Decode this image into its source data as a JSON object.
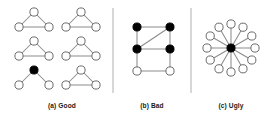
{
  "figure": {
    "background_color": "#ffffff",
    "width": 271,
    "height": 119,
    "node_fill_open": "#ffffff",
    "node_fill_filled": "#000000",
    "node_stroke": "#6b6b6b",
    "edge_color": "#8c8c8c",
    "divider_color": "#b0b0b0",
    "caption_color": "#1b1b1b"
  },
  "panels": [
    {
      "id": "good",
      "caption": "(a) Good",
      "caption_x": 62,
      "caption_y": 108,
      "graph_type": "triangle-motifs",
      "description": "Six three-node motifs arranged in a 2 by 3 grid; five are closed triangles, one has a filled hub and only two edges",
      "graphs": [
        {
          "id": "triangle-1",
          "row": 1,
          "column": 1,
          "nodes": [
            {
              "id": "apex",
              "x": 34,
              "y": 12,
              "fill": "open"
            },
            {
              "id": "left",
              "x": 19,
              "y": 27,
              "fill": "open"
            },
            {
              "id": "right",
              "x": 49,
              "y": 27,
              "fill": "open"
            }
          ],
          "edges": [
            [
              "apex",
              "left"
            ],
            [
              "apex",
              "right"
            ],
            [
              "left",
              "right"
            ]
          ]
        },
        {
          "id": "triangle-2",
          "row": 1,
          "column": 2,
          "nodes": [
            {
              "id": "apex",
              "x": 81,
              "y": 12,
              "fill": "open"
            },
            {
              "id": "left",
              "x": 66,
              "y": 27,
              "fill": "open"
            },
            {
              "id": "right",
              "x": 96,
              "y": 27,
              "fill": "open"
            }
          ],
          "edges": [
            [
              "apex",
              "left"
            ],
            [
              "apex",
              "right"
            ],
            [
              "left",
              "right"
            ]
          ]
        },
        {
          "id": "triangle-3",
          "row": 2,
          "column": 1,
          "nodes": [
            {
              "id": "apex",
              "x": 34,
              "y": 41,
              "fill": "open"
            },
            {
              "id": "left",
              "x": 19,
              "y": 56,
              "fill": "open"
            },
            {
              "id": "right",
              "x": 49,
              "y": 56,
              "fill": "open"
            }
          ],
          "edges": [
            [
              "apex",
              "left"
            ],
            [
              "apex",
              "right"
            ],
            [
              "left",
              "right"
            ]
          ]
        },
        {
          "id": "triangle-4",
          "row": 2,
          "column": 2,
          "nodes": [
            {
              "id": "apex",
              "x": 81,
              "y": 41,
              "fill": "open"
            },
            {
              "id": "left",
              "x": 66,
              "y": 56,
              "fill": "open"
            },
            {
              "id": "right",
              "x": 96,
              "y": 56,
              "fill": "open"
            }
          ],
          "edges": [
            [
              "apex",
              "left"
            ],
            [
              "apex",
              "right"
            ],
            [
              "left",
              "right"
            ]
          ]
        },
        {
          "id": "open-motif-filled-hub",
          "row": 3,
          "column": 1,
          "nodes": [
            {
              "id": "apex",
              "x": 34,
              "y": 70,
              "fill": "filled"
            },
            {
              "id": "left",
              "x": 19,
              "y": 85,
              "fill": "open"
            },
            {
              "id": "right",
              "x": 49,
              "y": 85,
              "fill": "open"
            }
          ],
          "edges": [
            [
              "apex",
              "left"
            ],
            [
              "apex",
              "right"
            ]
          ]
        },
        {
          "id": "triangle-6",
          "row": 3,
          "column": 2,
          "nodes": [
            {
              "id": "apex",
              "x": 81,
              "y": 70,
              "fill": "open"
            },
            {
              "id": "left",
              "x": 66,
              "y": 85,
              "fill": "open"
            },
            {
              "id": "right",
              "x": 96,
              "y": 85,
              "fill": "open"
            }
          ],
          "edges": [
            [
              "apex",
              "left"
            ],
            [
              "apex",
              "right"
            ],
            [
              "left",
              "right"
            ]
          ]
        }
      ]
    },
    {
      "id": "bad",
      "caption": "(b) Bad",
      "caption_x": 152,
      "caption_y": 108,
      "graph_type": "lattice",
      "description": "Three by two lattice with four filled nodes on the top two rows, two open nodes on the bottom row, and one diagonal chord",
      "nodes": [
        {
          "id": "tl",
          "x": 137,
          "y": 27,
          "fill": "filled"
        },
        {
          "id": "tr",
          "x": 170,
          "y": 27,
          "fill": "filled"
        },
        {
          "id": "ml",
          "x": 137,
          "y": 49,
          "fill": "filled"
        },
        {
          "id": "mr",
          "x": 170,
          "y": 49,
          "fill": "filled"
        },
        {
          "id": "bl",
          "x": 137,
          "y": 71,
          "fill": "open"
        },
        {
          "id": "br",
          "x": 170,
          "y": 71,
          "fill": "open"
        }
      ],
      "edges": [
        [
          "tl",
          "tr"
        ],
        [
          "ml",
          "mr"
        ],
        [
          "bl",
          "br"
        ],
        [
          "tl",
          "ml"
        ],
        [
          "ml",
          "bl"
        ],
        [
          "tr",
          "mr"
        ],
        [
          "mr",
          "br"
        ],
        [
          "ml",
          "tr"
        ]
      ]
    },
    {
      "id": "ugly",
      "caption": "(c) Ugly",
      "caption_x": 231,
      "caption_y": 108,
      "graph_type": "star",
      "description": "Star graph: one filled hub node connected to twelve open leaf nodes arranged on a circle",
      "hub": {
        "id": "hub",
        "x": 231,
        "y": 48,
        "fill": "filled"
      },
      "leaf_count": 12,
      "leaf_radius": 24,
      "leaf_start_angle_deg": -90,
      "leaves": [
        {
          "id": "leaf-1",
          "angle_deg": -90
        },
        {
          "id": "leaf-2",
          "angle_deg": -60
        },
        {
          "id": "leaf-3",
          "angle_deg": -30
        },
        {
          "id": "leaf-4",
          "angle_deg": 0
        },
        {
          "id": "leaf-5",
          "angle_deg": 30
        },
        {
          "id": "leaf-6",
          "angle_deg": 60
        },
        {
          "id": "leaf-7",
          "angle_deg": 90
        },
        {
          "id": "leaf-8",
          "angle_deg": 120
        },
        {
          "id": "leaf-9",
          "angle_deg": 150
        },
        {
          "id": "leaf-10",
          "angle_deg": 180
        },
        {
          "id": "leaf-11",
          "angle_deg": 210
        },
        {
          "id": "leaf-12",
          "angle_deg": 240
        }
      ]
    }
  ],
  "dividers": [
    {
      "id": "divider-1",
      "x": 113,
      "y1": 8,
      "y2": 93
    },
    {
      "id": "divider-2",
      "x": 191,
      "y1": 8,
      "y2": 93
    }
  ]
}
